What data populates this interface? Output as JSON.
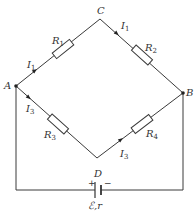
{
  "diagram": {
    "type": "wheatstone-bridge-circuit",
    "nodes": {
      "A": {
        "label": "A"
      },
      "B": {
        "label": "B"
      },
      "C": {
        "label": "C"
      },
      "D": {
        "label": "D"
      }
    },
    "resistors": [
      {
        "id": "R1",
        "name": "R",
        "sub": "1",
        "branch": "A-C"
      },
      {
        "id": "R2",
        "name": "R",
        "sub": "2",
        "branch": "C-B"
      },
      {
        "id": "R3",
        "name": "R",
        "sub": "3",
        "branch": "A-D"
      },
      {
        "id": "R4",
        "name": "R",
        "sub": "4",
        "branch": "D-B"
      }
    ],
    "currents": [
      {
        "name": "I",
        "sub": "1",
        "branch": "A-C"
      },
      {
        "name": "I",
        "sub": "1",
        "branch": "C-B"
      },
      {
        "name": "I",
        "sub": "3",
        "branch": "A-D"
      },
      {
        "name": "I",
        "sub": "3",
        "branch": "D-B"
      }
    ],
    "battery": {
      "plus": "+",
      "minus": "−",
      "label": "ℰ,r"
    }
  }
}
